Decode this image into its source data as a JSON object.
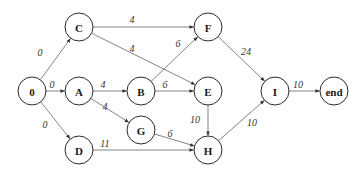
{
  "diagram": {
    "type": "directed-activity-network",
    "node_radius": 14,
    "colors": {
      "node_stroke": "#2a2a2a",
      "edge": "#777777",
      "text": "#1a1a1a",
      "background": "#ffffff"
    },
    "nodes": [
      {
        "id": "0",
        "label": "0",
        "x": 32,
        "y": 91
      },
      {
        "id": "C",
        "label": "C",
        "x": 79,
        "y": 27
      },
      {
        "id": "A",
        "label": "A",
        "x": 79,
        "y": 91
      },
      {
        "id": "D",
        "label": "D",
        "x": 79,
        "y": 150
      },
      {
        "id": "B",
        "label": "B",
        "x": 141,
        "y": 91
      },
      {
        "id": "G",
        "label": "G",
        "x": 141,
        "y": 130
      },
      {
        "id": "F",
        "label": "F",
        "x": 208,
        "y": 27
      },
      {
        "id": "E",
        "label": "E",
        "x": 208,
        "y": 91
      },
      {
        "id": "H",
        "label": "H",
        "x": 208,
        "y": 150
      },
      {
        "id": "I",
        "label": "I",
        "x": 275,
        "y": 91
      },
      {
        "id": "end",
        "label": "end",
        "x": 334,
        "y": 91
      }
    ],
    "edges": [
      {
        "from": "0",
        "to": "C",
        "weight": "0",
        "lx": 40,
        "ly": 52
      },
      {
        "from": "0",
        "to": "A",
        "weight": "0",
        "lx": 52,
        "ly": 84
      },
      {
        "from": "0",
        "to": "D",
        "weight": "0",
        "lx": 45,
        "ly": 124
      },
      {
        "from": "C",
        "to": "F",
        "weight": "4",
        "lx": 132,
        "ly": 19
      },
      {
        "from": "C",
        "to": "E",
        "weight": "4",
        "lx": 132,
        "ly": 48
      },
      {
        "from": "A",
        "to": "B",
        "weight": "4",
        "lx": 103,
        "ly": 84
      },
      {
        "from": "A",
        "to": "G",
        "weight": "4",
        "lx": 105,
        "ly": 106
      },
      {
        "from": "B",
        "to": "F",
        "weight": "6",
        "lx": 178,
        "ly": 43
      },
      {
        "from": "B",
        "to": "E",
        "weight": "6",
        "lx": 165,
        "ly": 84
      },
      {
        "from": "D",
        "to": "H",
        "weight": "11",
        "lx": 105,
        "ly": 143
      },
      {
        "from": "G",
        "to": "H",
        "weight": "6",
        "lx": 170,
        "ly": 133
      },
      {
        "from": "E",
        "to": "H",
        "weight": "10",
        "lx": 195,
        "ly": 119
      },
      {
        "from": "F",
        "to": "I",
        "weight": "24",
        "lx": 246,
        "ly": 51
      },
      {
        "from": "H",
        "to": "I",
        "weight": "10",
        "lx": 252,
        "ly": 122
      },
      {
        "from": "I",
        "to": "end",
        "weight": "10",
        "lx": 298,
        "ly": 84
      }
    ]
  }
}
